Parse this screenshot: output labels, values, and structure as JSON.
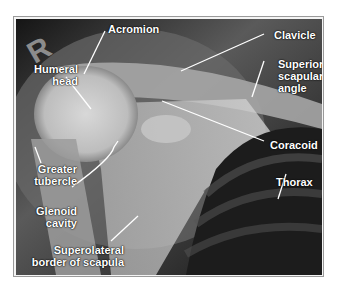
{
  "figure": {
    "type": "radiograph",
    "view": "shoulder (scapular) radiograph, right side",
    "side_marker": "R",
    "labels": [
      {
        "id": "acromion",
        "text": "Acromion"
      },
      {
        "id": "clavicle",
        "text": "Clavicle"
      },
      {
        "id": "humeral-head",
        "lines": [
          "Humeral",
          "head"
        ]
      },
      {
        "id": "superior-scapular-angle",
        "lines": [
          "Superior",
          "scapular",
          "angle"
        ]
      },
      {
        "id": "coracoid",
        "text": "Coracoid"
      },
      {
        "id": "greater-tubercle",
        "lines": [
          "Greater",
          "tubercle"
        ]
      },
      {
        "id": "thorax",
        "text": "Thorax"
      },
      {
        "id": "glenoid-cavity",
        "lines": [
          "Glenoid",
          "cavity"
        ]
      },
      {
        "id": "superolateral-border",
        "lines": [
          "Superolateral",
          "border of scapula"
        ]
      }
    ]
  },
  "colors": {
    "background": "#ffffff",
    "frame_border": "#9a9a9a",
    "label_text": "#ffffff",
    "leader_lines": "#ffffff"
  }
}
